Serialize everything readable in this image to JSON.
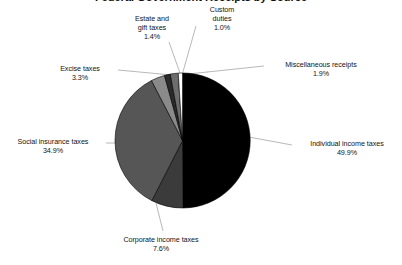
{
  "chart_data": {
    "type": "pie",
    "title": "Federal Government Receipts by Source",
    "title_visible": false,
    "categories": [
      "Individual income taxes",
      "Corporate income taxes",
      "Social insurance taxes",
      "Excise taxes",
      "Estate and gift taxes",
      "Miscellaneous receipts",
      "Custom duties"
    ],
    "values": [
      49.9,
      7.6,
      34.9,
      3.3,
      1.4,
      1.9,
      1.0
    ],
    "value_suffix": "%",
    "xlabel": "",
    "ylabel": "",
    "legend_position": "none",
    "grid": false,
    "start_angle_deg": 0,
    "direction": "clockwise",
    "slices": [
      {
        "label": "Individual income taxes",
        "value": 49.9,
        "value_text": "49.9%",
        "color": "#000000"
      },
      {
        "label": "Corporate income taxes",
        "value": 7.6,
        "value_text": "7.6%",
        "color": "#3b3b3b"
      },
      {
        "label": "Social insurance taxes",
        "value": 34.9,
        "value_text": "34.9%",
        "color": "#565656"
      },
      {
        "label": "Excise taxes",
        "value": 3.3,
        "value_text": "3.3%",
        "color": "#8a8a8a"
      },
      {
        "label": "Estate and gift taxes",
        "value": 1.4,
        "value_text": "1.4%",
        "color": "#2a2a2a"
      },
      {
        "label": "Miscellaneous receipts",
        "value": 1.9,
        "value_text": "1.9%",
        "color": "#6d6d6d"
      },
      {
        "label": "Custom duties",
        "value": 1.0,
        "value_text": "1.0%",
        "color": "#ffffff"
      }
    ]
  },
  "labels": {
    "estate": {
      "line1": "Estate and",
      "line2": "gift taxes",
      "pct": "1.4%"
    },
    "custom": {
      "line1": "Custom",
      "line2": "duties",
      "pct": "1.0%"
    },
    "misc": {
      "line1": "Miscellaneous receipts",
      "pct": "1.9%"
    },
    "excise": {
      "line1": "Excise taxes",
      "pct": "3.3%"
    },
    "social": {
      "line1": "Social insurance taxes",
      "pct": "34.9%"
    },
    "individual": {
      "line1": "Individual income taxes",
      "pct": "49.9%"
    },
    "corporate": {
      "line1": "Corporate income taxes",
      "pct": "7.6%"
    }
  },
  "colors": {
    "background": "#ffffff",
    "text": "#141414",
    "leader_line": "#9a9a9a",
    "slice_outline": "#000000"
  }
}
